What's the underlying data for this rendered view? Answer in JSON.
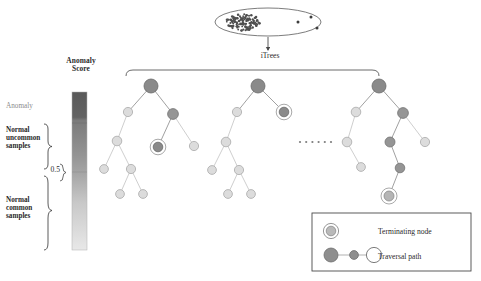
{
  "figure": {
    "type": "diagram"
  },
  "colorbar": {
    "title": "Anomaly\nScore",
    "top_label": "Anomaly",
    "mid_tick_label": "0.5",
    "bracket_labels": {
      "upper": "Normal\nuncommon\nsamples",
      "lower": "Normal\ncommon\nsamples"
    },
    "gradient_top_color": "#5d5d5d",
    "gradient_mid_color": "#9a9a9a",
    "gradient_bottom_color": "#e2e2e2"
  },
  "source": {
    "arrow_label": "iTrees",
    "cluster_point_count": 120,
    "outlier_point_count": 3
  },
  "forest": {
    "ellipsis": "......",
    "tree_count_shown": 3
  },
  "legend": {
    "terminating_node_label": "Terminating node",
    "traversal_path_label": "Traversal path"
  },
  "chart_data": {
    "type": "diagram",
    "colorbar_scale": {
      "axis_label": "Anomaly Score",
      "ticks": [
        {
          "value": 1.0,
          "label": "Anomaly"
        },
        {
          "value": 0.5,
          "label": "0.5"
        }
      ],
      "ranges": [
        {
          "label": "Anomaly",
          "from": 0.78,
          "to": 1.0
        },
        {
          "label": "Normal uncommon samples",
          "from": 0.5,
          "to": 0.78
        },
        {
          "label": "Normal common samples",
          "from": 0.0,
          "to": 0.5
        }
      ]
    },
    "trees": [
      {
        "name": "iTree 1",
        "nodes": [
          {
            "id": "t1n0",
            "x": 151,
            "y": 86,
            "r": 7.0,
            "shade": "dark",
            "terminal": false
          },
          {
            "id": "t1n1",
            "x": 128,
            "y": 112,
            "r": 4.6,
            "shade": "light",
            "terminal": false
          },
          {
            "id": "t1n2",
            "x": 173,
            "y": 114,
            "r": 5.4,
            "shade": "medium",
            "terminal": false
          },
          {
            "id": "t1n3",
            "x": 117,
            "y": 141,
            "r": 4.8,
            "shade": "light",
            "terminal": false
          },
          {
            "id": "t1n4",
            "x": 158,
            "y": 147,
            "r": 4.8,
            "shade": "dark",
            "terminal": true
          },
          {
            "id": "t1n5",
            "x": 194,
            "y": 146,
            "r": 4.6,
            "shade": "light",
            "terminal": false
          },
          {
            "id": "t1n6",
            "x": 104,
            "y": 169,
            "r": 4.4,
            "shade": "light",
            "terminal": false
          },
          {
            "id": "t1n7",
            "x": 131,
            "y": 169,
            "r": 4.6,
            "shade": "light",
            "terminal": false
          },
          {
            "id": "t1n8",
            "x": 120,
            "y": 194,
            "r": 4.4,
            "shade": "light",
            "terminal": false
          },
          {
            "id": "t1n9",
            "x": 143,
            "y": 194,
            "r": 4.4,
            "shade": "light",
            "terminal": false
          }
        ],
        "edges": [
          {
            "from": "t1n0",
            "to": "t1n1",
            "traversed": true
          },
          {
            "from": "t1n0",
            "to": "t1n2",
            "traversed": true
          },
          {
            "from": "t1n1",
            "to": "t1n3",
            "traversed": false
          },
          {
            "from": "t1n2",
            "to": "t1n4",
            "traversed": true
          },
          {
            "from": "t1n2",
            "to": "t1n5",
            "traversed": false
          },
          {
            "from": "t1n3",
            "to": "t1n6",
            "traversed": false
          },
          {
            "from": "t1n3",
            "to": "t1n7",
            "traversed": false
          },
          {
            "from": "t1n7",
            "to": "t1n8",
            "traversed": false
          },
          {
            "from": "t1n7",
            "to": "t1n9",
            "traversed": false
          }
        ]
      },
      {
        "name": "iTree 2",
        "nodes": [
          {
            "id": "t2n0",
            "x": 258,
            "y": 86,
            "r": 7.0,
            "shade": "dark",
            "terminal": false
          },
          {
            "id": "t2n1",
            "x": 237,
            "y": 112,
            "r": 4.6,
            "shade": "light",
            "terminal": false
          },
          {
            "id": "t2n2",
            "x": 284,
            "y": 112,
            "r": 4.8,
            "shade": "dark",
            "terminal": true
          },
          {
            "id": "t2n3",
            "x": 226,
            "y": 142,
            "r": 4.8,
            "shade": "light",
            "terminal": false
          },
          {
            "id": "t2n4",
            "x": 212,
            "y": 170,
            "r": 4.4,
            "shade": "light",
            "terminal": false
          },
          {
            "id": "t2n5",
            "x": 239,
            "y": 170,
            "r": 4.6,
            "shade": "light",
            "terminal": false
          },
          {
            "id": "t2n6",
            "x": 228,
            "y": 194,
            "r": 4.4,
            "shade": "light",
            "terminal": false
          },
          {
            "id": "t2n7",
            "x": 251,
            "y": 194,
            "r": 4.4,
            "shade": "light",
            "terminal": false
          }
        ],
        "edges": [
          {
            "from": "t2n0",
            "to": "t2n1",
            "traversed": true
          },
          {
            "from": "t2n0",
            "to": "t2n2",
            "traversed": true
          },
          {
            "from": "t2n1",
            "to": "t2n3",
            "traversed": false
          },
          {
            "from": "t2n3",
            "to": "t2n4",
            "traversed": false
          },
          {
            "from": "t2n3",
            "to": "t2n5",
            "traversed": false
          },
          {
            "from": "t2n5",
            "to": "t2n6",
            "traversed": false
          },
          {
            "from": "t2n5",
            "to": "t2n7",
            "traversed": false
          }
        ]
      },
      {
        "name": "iTree 3",
        "nodes": [
          {
            "id": "t3n0",
            "x": 379,
            "y": 86,
            "r": 7.0,
            "shade": "dark",
            "terminal": false
          },
          {
            "id": "t3n1",
            "x": 356,
            "y": 112,
            "r": 4.8,
            "shade": "light",
            "terminal": false
          },
          {
            "id": "t3n2",
            "x": 403,
            "y": 113,
            "r": 5.4,
            "shade": "medium",
            "terminal": false
          },
          {
            "id": "t3n3",
            "x": 347,
            "y": 142,
            "r": 4.8,
            "shade": "light",
            "terminal": false
          },
          {
            "id": "t3n4",
            "x": 390,
            "y": 142,
            "r": 5.0,
            "shade": "medium",
            "terminal": false
          },
          {
            "id": "t3n5",
            "x": 425,
            "y": 142,
            "r": 4.6,
            "shade": "light",
            "terminal": false
          },
          {
            "id": "t3n6",
            "x": 361,
            "y": 167,
            "r": 4.4,
            "shade": "light",
            "terminal": false
          },
          {
            "id": "t3n7",
            "x": 400,
            "y": 168,
            "r": 4.8,
            "shade": "medium",
            "terminal": false
          },
          {
            "id": "t3n8",
            "x": 389,
            "y": 196,
            "r": 5.0,
            "shade": "mid-light",
            "terminal": true
          }
        ],
        "edges": [
          {
            "from": "t3n0",
            "to": "t3n1",
            "traversed": true
          },
          {
            "from": "t3n0",
            "to": "t3n2",
            "traversed": true
          },
          {
            "from": "t3n1",
            "to": "t3n3",
            "traversed": false
          },
          {
            "from": "t3n2",
            "to": "t3n4",
            "traversed": true
          },
          {
            "from": "t3n2",
            "to": "t3n5",
            "traversed": false
          },
          {
            "from": "t3n3",
            "to": "t3n6",
            "traversed": false
          },
          {
            "from": "t3n4",
            "to": "t3n7",
            "traversed": true
          },
          {
            "from": "t3n7",
            "to": "t3n8",
            "traversed": true
          }
        ]
      }
    ]
  }
}
